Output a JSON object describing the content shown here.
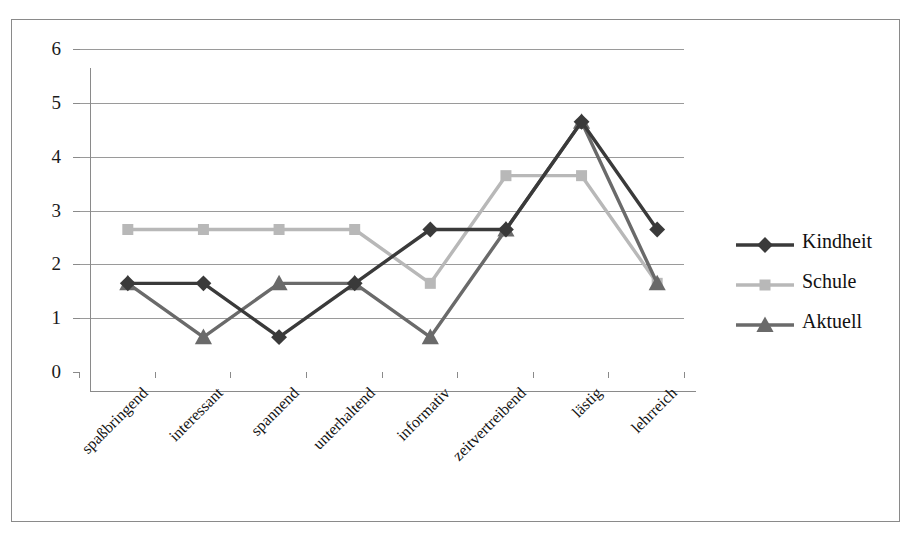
{
  "chart_data": {
    "type": "line",
    "title": "",
    "xlabel": "",
    "ylabel": "",
    "ylim": [
      0,
      6
    ],
    "yticks": [
      0,
      1,
      2,
      3,
      4,
      5,
      6
    ],
    "grid": true,
    "legend_position": "right",
    "categories": [
      "spaßbringend",
      "interessant",
      "spannend",
      "unterhaltend",
      "informativ",
      "zeitvertreibend",
      "lästig",
      "lehrreich"
    ],
    "series": [
      {
        "name": "Kindheit",
        "marker": "diamond",
        "color": "#3a3a3a",
        "values": [
          2,
          2,
          1,
          2,
          3,
          3,
          5,
          3
        ]
      },
      {
        "name": "Schule",
        "marker": "square",
        "color": "#b8b8b8",
        "values": [
          3,
          3,
          3,
          3,
          2,
          4,
          4,
          2
        ]
      },
      {
        "name": "Aktuell",
        "marker": "triangle",
        "color": "#6a6a6a",
        "values": [
          2,
          1,
          2,
          2,
          1,
          3,
          5,
          2
        ]
      }
    ]
  },
  "legend": {
    "items": [
      {
        "label": "Kindheit"
      },
      {
        "label": "Schule"
      },
      {
        "label": "Aktuell"
      }
    ]
  },
  "axes": {
    "y_tick_labels": [
      "0",
      "1",
      "2",
      "3",
      "4",
      "5",
      "6"
    ],
    "x_tick_labels": [
      "spaßbringend",
      "interessant",
      "spannend",
      "unterhaltend",
      "informativ",
      "zeitvertreibend",
      "lästig",
      "lehrreich"
    ]
  },
  "colors": {
    "kindheit": "#3a3a3a",
    "schule": "#b8b8b8",
    "aktuell": "#6a6a6a",
    "grid": "#9a9a9a",
    "axis": "#8a8a8a",
    "frame": "#8a8a8a",
    "background": "#ffffff"
  }
}
